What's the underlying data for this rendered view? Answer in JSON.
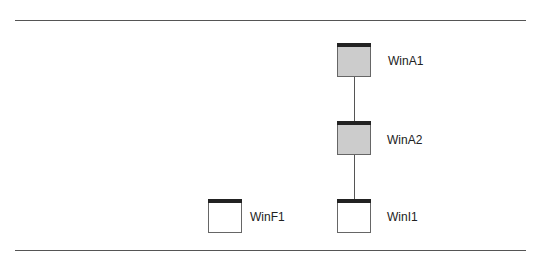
{
  "diagram": {
    "nodes": [
      {
        "id": "WinA1",
        "label": "WinA1",
        "fill": "#cccccc"
      },
      {
        "id": "WinA2",
        "label": "WinA2",
        "fill": "#cccccc"
      },
      {
        "id": "WinI1",
        "label": "WinI1",
        "fill": "#ffffff"
      },
      {
        "id": "WinF1",
        "label": "WinF1",
        "fill": "#ffffff"
      }
    ],
    "edges": [
      {
        "from": "WinA1",
        "to": "WinA2"
      },
      {
        "from": "WinA2",
        "to": "WinI1"
      }
    ]
  }
}
